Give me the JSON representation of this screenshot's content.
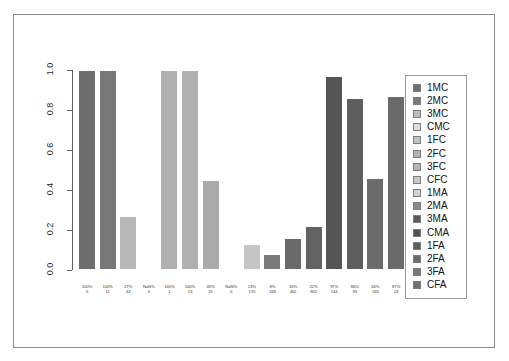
{
  "figure": {
    "artifact_text": "",
    "frame_visible": true
  },
  "chart_data": {
    "type": "bar",
    "title": "",
    "subtitle": "",
    "xlabel": "",
    "ylabel": "",
    "ylim": [
      0.0,
      1.0
    ],
    "grid": false,
    "legend_position": "right",
    "y_ticks": [
      "0.0",
      "0.2",
      "0.4",
      "0.6",
      "0.8",
      "1.0"
    ],
    "y_tick_values": [
      0.0,
      0.2,
      0.4,
      0.6,
      0.8,
      1.0
    ],
    "categories": [
      "1MC",
      "2MC",
      "3MC",
      "CMC",
      "1FC",
      "2FC",
      "3FC",
      "CFC",
      "1MA",
      "2MA",
      "3MA",
      "CMA",
      "1FA",
      "2FA",
      "3FA",
      "CFA"
    ],
    "values": [
      1.0,
      1.0,
      0.27,
      null,
      1.0,
      1.0,
      0.45,
      null,
      0.13,
      0.08,
      0.16,
      0.22,
      0.97,
      0.86,
      0.46,
      0.87
    ],
    "percent_labels": [
      "100%",
      "100%",
      "27%",
      "NaN%",
      "100%",
      "100%",
      "45%",
      "NaN%",
      "13%",
      "8%",
      "16%",
      "22%",
      "97%",
      "86%",
      "46%",
      "87%"
    ],
    "count_labels": [
      "5",
      "11",
      "44",
      "0",
      "1",
      "13",
      "31",
      "0",
      "170",
      "168",
      "462",
      "862",
      "144",
      "93",
      "165",
      "23"
    ],
    "bar_colors": [
      "#6e6e6e",
      "#787878",
      "#b8b8b8",
      "#d6d6d6",
      "#b0b0b0",
      "#b0b0b0",
      "#aaaaaa",
      "#d0d0d0",
      "#c6c6c6",
      "#7a7a7a",
      "#6a6a6a",
      "#636363",
      "#555555",
      "#5e5e5e",
      "#6c6c6c",
      "#6a6a6a"
    ],
    "legend_entries": [
      {
        "label": "1MC",
        "color": "#6e6e6e"
      },
      {
        "label": "2MC",
        "color": "#7c7c7c"
      },
      {
        "label": "3MC",
        "color": "#bdbdbd"
      },
      {
        "label": "CMC",
        "color": "#dcdcdc"
      },
      {
        "label": "1FC",
        "color": "#c2c2c2"
      },
      {
        "label": "2FC",
        "color": "#b2b2b2"
      },
      {
        "label": "3FC",
        "color": "#b6b6b6"
      },
      {
        "label": "CFC",
        "color": "#c9c9c9"
      },
      {
        "label": "1MA",
        "color": "#d2d2d2"
      },
      {
        "label": "2MA",
        "color": "#8a8a8a"
      },
      {
        "label": "3MA",
        "color": "#5a5a5a"
      },
      {
        "label": "CMA",
        "color": "#4f4f4f"
      },
      {
        "label": "1FA",
        "color": "#5c5c5c"
      },
      {
        "label": "2FA",
        "color": "#6a6a6a"
      },
      {
        "label": "3FA",
        "color": "#777777"
      },
      {
        "label": "CFA",
        "color": "#707070"
      }
    ]
  }
}
